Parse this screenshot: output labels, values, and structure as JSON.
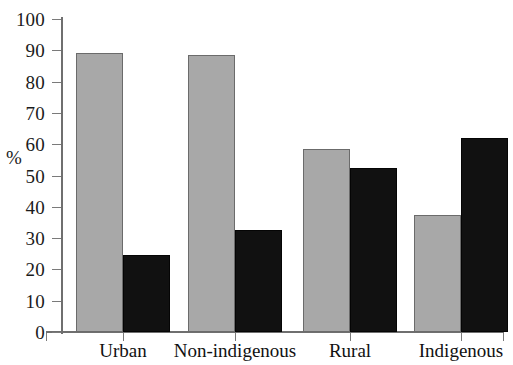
{
  "chart_data": {
    "type": "bar",
    "title": "",
    "subtitle": "",
    "xlabel": "",
    "ylabel": "%",
    "ylim": [
      0,
      100
    ],
    "ytick_labels": [
      "100",
      "90",
      "80",
      "70",
      "60",
      "50",
      "40",
      "30",
      "20",
      "10",
      "0"
    ],
    "ytick_values": [
      100,
      90,
      80,
      70,
      60,
      50,
      40,
      30,
      20,
      10,
      0
    ],
    "grid": false,
    "legend": "none",
    "categories": [
      "Urban",
      "Non-indigenous",
      "Rural",
      "Indigenous"
    ],
    "series": [
      {
        "name": "series-gray",
        "color": "#a8a8a8",
        "values": [
          89,
          88.5,
          58.5,
          37.5
        ]
      },
      {
        "name": "series-black",
        "color": "#111111",
        "values": [
          24.5,
          32.5,
          52.5,
          62
        ]
      }
    ]
  },
  "axis": {
    "y_title": "%"
  }
}
